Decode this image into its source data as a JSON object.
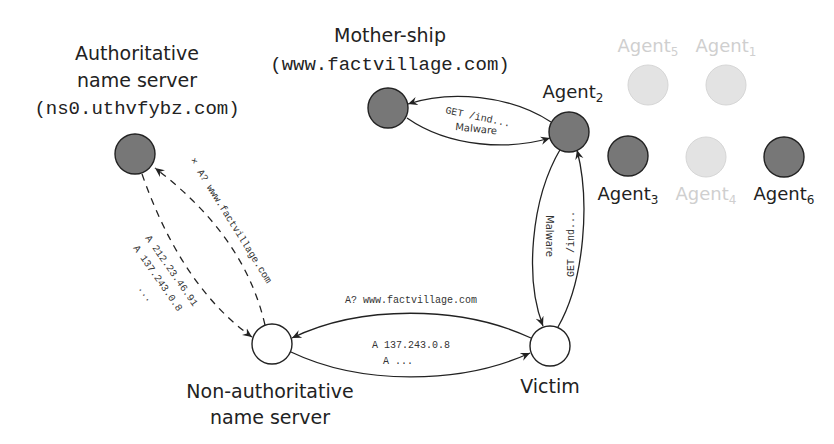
{
  "colors": {
    "dark_node": "#777777",
    "faded_node": "#e3e3e3",
    "white_node": "#ffffff",
    "stroke": "#222222",
    "faded_label": "#cccccc"
  },
  "nodes": {
    "authoritative": {
      "title_line1": "Authoritative",
      "title_line2": "name server",
      "host": "(ns0.uthvfybz.com)"
    },
    "mothership": {
      "title": "Mother-ship",
      "host": "(www.factvillage.com)"
    },
    "non_authoritative": {
      "title_line1": "Non-authoritative",
      "title_line2": "name server"
    },
    "victim": {
      "title": "Victim"
    },
    "agents": [
      {
        "id": "agent2",
        "base": "Agent",
        "sub": "2",
        "active": true
      },
      {
        "id": "agent5",
        "base": "Agent",
        "sub": "5",
        "active": false
      },
      {
        "id": "agent1",
        "base": "Agent",
        "sub": "1",
        "active": false
      },
      {
        "id": "agent3",
        "base": "Agent",
        "sub": "3",
        "active": true
      },
      {
        "id": "agent4",
        "base": "Agent",
        "sub": "4",
        "active": false
      },
      {
        "id": "agent6",
        "base": "Agent",
        "sub": "6",
        "active": true
      }
    ]
  },
  "edges": {
    "auth_query": "A? www.factvillage.com",
    "auth_query_marker": "×",
    "auth_answer_1": "A 212.23.46.91",
    "auth_answer_2": "A 137.243.0.8",
    "auth_answer_3": "...",
    "victim_query": "A? www.factvillage.com",
    "victim_answer_1": "A 137.243.0.8",
    "victim_answer_2": "A ...",
    "agent_to_mothership_1": "GET /ind...",
    "agent_to_mothership_2": "Malware",
    "victim_to_agent": "GET /ind...",
    "agent_to_victim": "Malware"
  }
}
